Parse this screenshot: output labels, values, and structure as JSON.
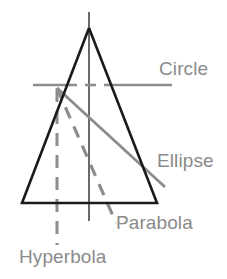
{
  "figure": {
    "colors": {
      "cone_stroke": "#1a1a1a",
      "axis": "#5a5a5a",
      "section_line": "#8c8c8c",
      "label_text": "#8a8a8a",
      "background": "#ffffff"
    },
    "cone": {
      "name": "cone-triangle",
      "apex": [
        89,
        28
      ],
      "base_left": [
        22,
        203
      ],
      "base_right": [
        157,
        203
      ],
      "stroke_width": 2.6
    },
    "axis": {
      "name": "cone-axis",
      "x": 89,
      "y_top": 12,
      "y_bottom": 221,
      "stroke_width": 1.8
    },
    "sections": [
      {
        "id": "circle",
        "label": "Circle",
        "style": "dashed-through-cone",
        "description": "Horizontal cut perpendicular to the axis",
        "x1": 33,
        "y1": 85,
        "x2": 172,
        "y2": 85
      },
      {
        "id": "ellipse",
        "label": "Ellipse",
        "style": "solid",
        "description": "Oblique cut that meets both sides of the cone",
        "x1": 57,
        "y1": 88,
        "x2": 165,
        "y2": 187
      },
      {
        "id": "parabola",
        "label": "Parabola",
        "style": "dashed",
        "description": "Cut parallel to a generating side of the cone",
        "x1": 57,
        "y1": 88,
        "x2": 116,
        "y2": 223
      },
      {
        "id": "hyperbola",
        "label": "Hyperbola",
        "style": "dashed-vertical",
        "description": "Cut parallel to the axis of the cone",
        "x1": 57,
        "y1": 89,
        "x2": 57,
        "y2": 245
      }
    ]
  }
}
